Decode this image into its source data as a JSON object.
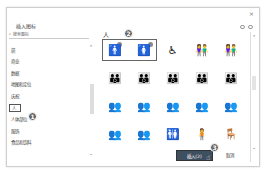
{
  "dialog": {
    "title": "插入图标",
    "close": "×"
  },
  "search": {
    "icon": "search-icon",
    "placeholder": "搜索图标"
  },
  "categories": [
    {
      "label": "箭"
    },
    {
      "label": "商业"
    },
    {
      "label": "数据"
    },
    {
      "label": "地图和定位"
    },
    {
      "label": "庆祝"
    },
    {
      "label": "人",
      "selected": true
    },
    {
      "label": "人体部位"
    },
    {
      "label": "服饰"
    },
    {
      "label": "食品和饮料"
    }
  ],
  "section": {
    "title": "人"
  },
  "icons": [
    {
      "name": "man-icon",
      "glyph": "🚹"
    },
    {
      "name": "woman-icon",
      "glyph": "🚺"
    },
    {
      "name": "wheelchair-icon",
      "glyph": "♿"
    },
    {
      "name": "couple-icon",
      "glyph": "👫"
    },
    {
      "name": "couple-2-icon",
      "glyph": "👫"
    },
    {
      "name": "family-1-icon",
      "glyph": "👪"
    },
    {
      "name": "family-2-icon",
      "glyph": "👪"
    },
    {
      "name": "parent-child-1-icon",
      "glyph": "👪"
    },
    {
      "name": "parent-child-2-icon",
      "glyph": "👪"
    },
    {
      "name": "parent-child-3-icon",
      "glyph": "👪"
    },
    {
      "name": "group-1-icon",
      "glyph": "👥"
    },
    {
      "name": "group-2-icon",
      "glyph": "👥"
    },
    {
      "name": "group-3-icon",
      "glyph": "👥"
    },
    {
      "name": "group-4-icon",
      "glyph": "👥"
    },
    {
      "name": "group-5-icon",
      "glyph": "👥"
    },
    {
      "name": "crowd-icon",
      "glyph": "👥"
    },
    {
      "name": "meeting-icon",
      "glyph": "👥"
    },
    {
      "name": "restroom-icon",
      "glyph": "🚻"
    },
    {
      "name": "person-standing-icon",
      "glyph": "🧍"
    },
    {
      "name": "person-seated-icon",
      "glyph": "🪑"
    }
  ],
  "badges": {
    "b1": "1",
    "b2": "2",
    "b3": "3"
  },
  "buttons": {
    "insert": "插入(2)",
    "cancel": "取消"
  }
}
